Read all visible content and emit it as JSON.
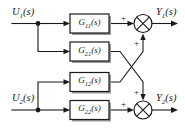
{
  "diagram": {
    "type": "control-block-diagram",
    "stroke_color": "#1a1a1a",
    "background_color": "#ffffff",
    "inputs": [
      {
        "id": "u1",
        "label_html": "U<sub>1</sub>(s)",
        "label_text": "U1(s)"
      },
      {
        "id": "u2",
        "label_html": "U<sub>2</sub>(s)",
        "label_text": "U2(s)"
      }
    ],
    "outputs": [
      {
        "id": "y1",
        "label_html": "Y<sub>1</sub>(s)",
        "label_text": "Y1(s)"
      },
      {
        "id": "y2",
        "label_html": "Y<sub>2</sub>(s)",
        "label_text": "Y2(s)"
      }
    ],
    "blocks": [
      {
        "id": "g11",
        "label_html": "G<sub>11</sub>(s)",
        "label_text": "G11(s)",
        "from": "u1",
        "to": "sum1"
      },
      {
        "id": "g21",
        "label_html": "G<sub>21</sub>(s)",
        "label_text": "G21(s)",
        "from": "u1",
        "to": "sum2"
      },
      {
        "id": "g12",
        "label_html": "G<sub>12</sub>(s)",
        "label_text": "G12(s)",
        "from": "u2",
        "to": "sum1"
      },
      {
        "id": "g22",
        "label_html": "G<sub>22</sub>(s)",
        "label_text": "G22(s)",
        "from": "u2",
        "to": "sum2"
      }
    ],
    "summing_junctions": [
      {
        "id": "sum1",
        "output": "y1",
        "signs": [
          {
            "port": "left",
            "sign": "+"
          },
          {
            "port": "bottom",
            "sign": "+"
          }
        ]
      },
      {
        "id": "sum2",
        "output": "y2",
        "signs": [
          {
            "port": "left",
            "sign": "+"
          },
          {
            "port": "top",
            "sign": "+"
          }
        ]
      }
    ],
    "junction_nodes": [
      {
        "id": "node-u1",
        "splits_to": [
          "g11",
          "g21"
        ]
      },
      {
        "id": "node-u2",
        "splits_to": [
          "g12",
          "g22"
        ]
      }
    ]
  }
}
